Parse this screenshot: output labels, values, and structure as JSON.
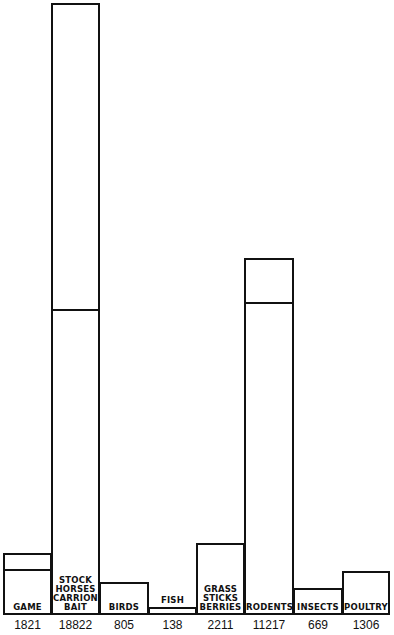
{
  "chart_data": {
    "type": "bar",
    "title": "",
    "xlabel": "",
    "ylabel": "",
    "grid": false,
    "legend": "none",
    "categories": [
      "GAME",
      "STOCK HORSES CARRION BAIT",
      "BIRDS",
      "FISH",
      "GRASS STICKS BERRIES",
      "RODENTS",
      "INSECTS",
      "POULTRY"
    ],
    "values": [
      1821,
      18822,
      805,
      138,
      2211,
      11217,
      669,
      1306
    ],
    "category_labels": [
      "GAME",
      "STOCK\nHORSES\nCARRION\nBAIT",
      "BIRDS",
      "FISH",
      "GRASS\nSTICKS\nBERRIES",
      "RODENTS",
      "INSECTS",
      "POULTRY"
    ],
    "value_labels": [
      "1821",
      "18822",
      "805",
      "138",
      "2211",
      "11217",
      "669",
      "1306"
    ],
    "sub_divisions": {
      "GAME": "inner line below top",
      "STOCK HORSES CARRION BAIT": "inner line near middle",
      "RODENTS": "inner line below top"
    }
  },
  "bars": [
    {
      "x": 3,
      "w": 49,
      "top": 553,
      "divider": 569,
      "label": "GAME",
      "value": "1821"
    },
    {
      "x": 51,
      "w": 49,
      "top": 3,
      "divider": 309,
      "label": "STOCK\nHORSES\nCARRION\nBAIT",
      "value": "18822"
    },
    {
      "x": 99,
      "w": 50,
      "top": 582,
      "divider": null,
      "label": "BIRDS",
      "value": "805"
    },
    {
      "x": 148,
      "w": 49,
      "top": 607,
      "divider": null,
      "label": "FISH",
      "value": "138"
    },
    {
      "x": 196,
      "w": 49,
      "top": 543,
      "divider": null,
      "label": "GRASS\nSTICKS\nBERRIES",
      "value": "2211"
    },
    {
      "x": 244,
      "w": 50,
      "top": 258,
      "divider": 302,
      "label": "RODENTS",
      "value": "11217"
    },
    {
      "x": 293,
      "w": 50,
      "top": 588,
      "divider": null,
      "label": "INSECTS",
      "value": "669"
    },
    {
      "x": 342,
      "w": 48,
      "top": 571,
      "divider": null,
      "label": "POULTRY",
      "value": "1306"
    }
  ]
}
